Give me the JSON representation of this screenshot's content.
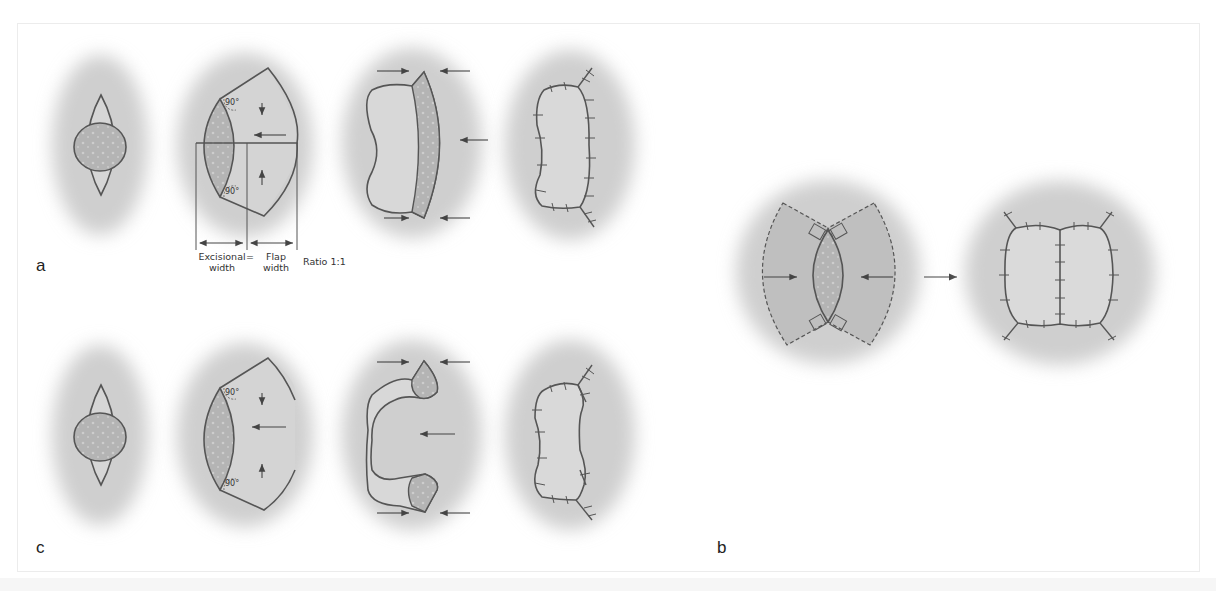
{
  "figure": {
    "panels": [
      {
        "id": "a",
        "label": "a",
        "steps": 4,
        "description": "Rhomboid excision with single rotation/advancement flap, closure"
      },
      {
        "id": "b",
        "label": "b",
        "steps": 2,
        "description": "Bilateral flaps closing central lenticular defect, arrow to sutured result"
      },
      {
        "id": "c",
        "label": "c",
        "steps": 4,
        "description": "Rhomboid excision with modified flap leaving two tabs, closure"
      }
    ],
    "annotations": {
      "angle_top": "90°",
      "angle_bottom": "90°",
      "excisional_width": "Excisional width",
      "excisional_line1": "Excisional",
      "excisional_line2": "width",
      "equals": "=",
      "flap_line1": "Flap",
      "flap_line2": "width",
      "ratio": "Ratio 1:1"
    },
    "colors": {
      "skin": "#d4d4d4",
      "skin_edge": "#e8e8e8",
      "lesion": "#b0b0b0",
      "flap": "#bdbdbd",
      "outline": "#555555",
      "text": "#333333",
      "background": "#ffffff"
    }
  }
}
